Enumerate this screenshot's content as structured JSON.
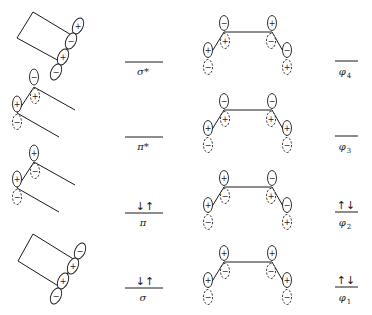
{
  "figure": {
    "background": "#ffffff",
    "ink": "#1a1a1a"
  },
  "localized_orbitals": {
    "column_labels": [
      {
        "id": "sigma_star",
        "text": "σ*",
        "level_y": 62,
        "electrons": ""
      },
      {
        "id": "pi_star",
        "text": "π*",
        "level_y": 137,
        "electrons": ""
      },
      {
        "id": "pi",
        "text": "π",
        "level_y": 213,
        "electrons": "↓↑"
      },
      {
        "id": "sigma",
        "text": "σ",
        "level_y": 288,
        "electrons": "↓↑"
      }
    ],
    "diagrams": [
      {
        "id": "sigma_star_orbital",
        "type": "sigma",
        "signs": [
          "+",
          "−",
          "+",
          "−"
        ]
      },
      {
        "id": "pi_star_orbital",
        "type": "pi",
        "signs": [
          "−",
          "+",
          "+",
          "−"
        ]
      },
      {
        "id": "pi_orbital",
        "type": "pi",
        "signs": [
          "+",
          "−",
          "+",
          "−"
        ]
      },
      {
        "id": "sigma_orbital",
        "type": "sigma",
        "signs": [
          "−",
          "+",
          "+",
          "−"
        ]
      }
    ]
  },
  "delocalized_orbitals": {
    "column_labels": [
      {
        "id": "phi4",
        "symbol": "φ",
        "subscript": "4",
        "level_y": 61,
        "electrons": ""
      },
      {
        "id": "phi3",
        "symbol": "φ",
        "subscript": "3",
        "level_y": 136,
        "electrons": ""
      },
      {
        "id": "phi2",
        "symbol": "φ",
        "subscript": "2",
        "level_y": 212,
        "electrons": "↑↓"
      },
      {
        "id": "phi1",
        "symbol": "φ",
        "subscript": "1",
        "level_y": 287,
        "electrons": "↑↓"
      }
    ],
    "diagrams": [
      {
        "id": "phi4_orbital",
        "atoms": [
          {
            "top": "+",
            "bottom": "−"
          },
          {
            "top": "−",
            "bottom": "+"
          },
          {
            "top": "+",
            "bottom": "−"
          },
          {
            "top": "−",
            "bottom": "+"
          }
        ]
      },
      {
        "id": "phi3_orbital",
        "atoms": [
          {
            "top": "+",
            "bottom": "−"
          },
          {
            "top": "−",
            "bottom": "+"
          },
          {
            "top": "−",
            "bottom": "+"
          },
          {
            "top": "+",
            "bottom": "−"
          }
        ]
      },
      {
        "id": "phi2_orbital",
        "atoms": [
          {
            "top": "+",
            "bottom": "−"
          },
          {
            "top": "+",
            "bottom": "−"
          },
          {
            "top": "−",
            "bottom": "+"
          },
          {
            "top": "−",
            "bottom": "+"
          }
        ]
      },
      {
        "id": "phi1_orbital",
        "atoms": [
          {
            "top": "+",
            "bottom": "−"
          },
          {
            "top": "+",
            "bottom": "−"
          },
          {
            "top": "+",
            "bottom": "−"
          },
          {
            "top": "+",
            "bottom": "−"
          }
        ]
      }
    ]
  }
}
